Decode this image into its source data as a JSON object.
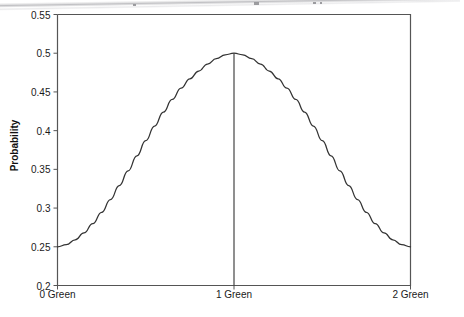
{
  "chart_data": {
    "type": "line",
    "title": "",
    "xlabel": "",
    "ylabel": "Probability",
    "xlim": [
      0,
      2
    ],
    "ylim": [
      0.2,
      0.55
    ],
    "grid": false,
    "legend": null,
    "x_tick_labels": [
      "0 Green",
      "1 Green",
      "2 Green"
    ],
    "x_tick_values": [
      0,
      1,
      2
    ],
    "y_tick_labels": [
      "0.2",
      "0.25",
      "0.3",
      "0.35",
      "0.4",
      "0.45",
      "0.5",
      "0.55"
    ],
    "y_tick_values": [
      0.2,
      0.25,
      0.3,
      0.35,
      0.4,
      0.45,
      0.5,
      0.55
    ],
    "series": [
      {
        "name": "Probability",
        "x": [
          0.0,
          0.1,
          0.2,
          0.3,
          0.4,
          0.5,
          0.6,
          0.7,
          0.8,
          0.9,
          1.0,
          1.1,
          1.2,
          1.3,
          1.4,
          1.5,
          1.6,
          1.7,
          1.8,
          1.9,
          2.0
        ],
        "values": [
          0.25,
          0.2578,
          0.2806,
          0.3164,
          0.3622,
          0.414,
          0.467,
          0.5,
          0.5,
          0.5,
          0.5,
          0.5,
          0.5,
          0.5,
          0.467,
          0.414,
          0.3622,
          0.3164,
          0.2806,
          0.2578,
          0.25
        ]
      }
    ],
    "curve_points": [
      {
        "x": 0.0,
        "y": 0.25
      },
      {
        "x": 0.05,
        "y": 0.2528
      },
      {
        "x": 0.1,
        "y": 0.259
      },
      {
        "x": 0.15,
        "y": 0.268
      },
      {
        "x": 0.2,
        "y": 0.28
      },
      {
        "x": 0.25,
        "y": 0.2945
      },
      {
        "x": 0.3,
        "y": 0.311
      },
      {
        "x": 0.35,
        "y": 0.329
      },
      {
        "x": 0.4,
        "y": 0.348
      },
      {
        "x": 0.45,
        "y": 0.3675
      },
      {
        "x": 0.5,
        "y": 0.387
      },
      {
        "x": 0.55,
        "y": 0.406
      },
      {
        "x": 0.6,
        "y": 0.424
      },
      {
        "x": 0.65,
        "y": 0.4405
      },
      {
        "x": 0.7,
        "y": 0.455
      },
      {
        "x": 0.75,
        "y": 0.467
      },
      {
        "x": 0.8,
        "y": 0.477
      },
      {
        "x": 0.85,
        "y": 0.486
      },
      {
        "x": 0.9,
        "y": 0.493
      },
      {
        "x": 0.95,
        "y": 0.498
      },
      {
        "x": 1.0,
        "y": 0.5
      },
      {
        "x": 1.05,
        "y": 0.498
      },
      {
        "x": 1.1,
        "y": 0.493
      },
      {
        "x": 1.15,
        "y": 0.486
      },
      {
        "x": 1.2,
        "y": 0.477
      },
      {
        "x": 1.25,
        "y": 0.467
      },
      {
        "x": 1.3,
        "y": 0.455
      },
      {
        "x": 1.35,
        "y": 0.4405
      },
      {
        "x": 1.4,
        "y": 0.424
      },
      {
        "x": 1.45,
        "y": 0.406
      },
      {
        "x": 1.5,
        "y": 0.387
      },
      {
        "x": 1.55,
        "y": 0.3675
      },
      {
        "x": 1.6,
        "y": 0.348
      },
      {
        "x": 1.65,
        "y": 0.329
      },
      {
        "x": 1.7,
        "y": 0.311
      },
      {
        "x": 1.75,
        "y": 0.2945
      },
      {
        "x": 1.8,
        "y": 0.28
      },
      {
        "x": 1.85,
        "y": 0.268
      },
      {
        "x": 1.9,
        "y": 0.259
      },
      {
        "x": 1.95,
        "y": 0.2528
      },
      {
        "x": 2.0,
        "y": 0.25
      }
    ],
    "annotations": [
      {
        "name": "peak-marker-line",
        "type": "vline",
        "x": 1.0,
        "y_from": 0.2,
        "y_to": 0.5,
        "label": "1 Green"
      }
    ],
    "colors": {
      "curve": "#333333",
      "axis": "#555555",
      "marker_line": "#333333",
      "text": "#1a1a1a",
      "background": "#ffffff"
    }
  },
  "axis": {
    "y_title": "Probability",
    "y_ticks": [
      "0.55",
      "0.5",
      "0.45",
      "0.4",
      "0.35",
      "0.3",
      "0.25",
      "0.2"
    ],
    "x_ticks": [
      "0 Green",
      "1 Green",
      "2 Green"
    ]
  }
}
